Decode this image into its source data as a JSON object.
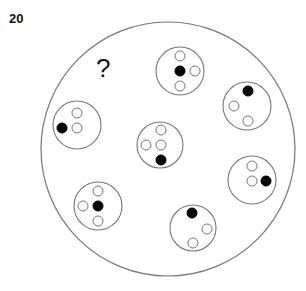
{
  "puzzle": {
    "number": "20",
    "unknown_marker": "?"
  },
  "colors": {
    "outline": "#777777",
    "filled_dot": "#000000",
    "open_dot_fill": "#ffffff",
    "background": "#ffffff"
  },
  "outer_circle": {
    "cx": 168,
    "cy": 149,
    "r": 127
  },
  "groups": [
    {
      "id": "top",
      "cx": 180,
      "cy": 71,
      "r": 24,
      "dots": [
        {
          "x": 180,
          "y": 56,
          "filled": false
        },
        {
          "x": 180,
          "y": 71,
          "filled": true
        },
        {
          "x": 195,
          "y": 71,
          "filled": false
        },
        {
          "x": 180,
          "y": 86,
          "filled": false
        }
      ]
    },
    {
      "id": "upper-right",
      "cx": 247,
      "cy": 106,
      "r": 24,
      "dots": [
        {
          "x": 248,
          "y": 91,
          "filled": true
        },
        {
          "x": 234,
          "y": 106,
          "filled": false
        },
        {
          "x": 248,
          "y": 121,
          "filled": false
        }
      ]
    },
    {
      "id": "left",
      "cx": 77,
      "cy": 125,
      "r": 24,
      "dots": [
        {
          "x": 77,
          "y": 113,
          "filled": false
        },
        {
          "x": 62,
          "y": 128,
          "filled": true
        },
        {
          "x": 77,
          "y": 128,
          "filled": false
        }
      ]
    },
    {
      "id": "center",
      "cx": 160,
      "cy": 145,
      "r": 23,
      "dots": [
        {
          "x": 161,
          "y": 130,
          "filled": false
        },
        {
          "x": 146,
          "y": 145,
          "filled": false
        },
        {
          "x": 161,
          "y": 145,
          "filled": false
        },
        {
          "x": 161,
          "y": 160,
          "filled": true
        }
      ]
    },
    {
      "id": "right",
      "cx": 252,
      "cy": 180,
      "r": 24,
      "dots": [
        {
          "x": 252,
          "y": 166,
          "filled": false
        },
        {
          "x": 252,
          "y": 181,
          "filled": false
        },
        {
          "x": 266,
          "y": 181,
          "filled": true
        }
      ]
    },
    {
      "id": "lower-left",
      "cx": 98,
      "cy": 206,
      "r": 24,
      "dots": [
        {
          "x": 98,
          "y": 191,
          "filled": false
        },
        {
          "x": 83,
          "y": 206,
          "filled": false
        },
        {
          "x": 98,
          "y": 206,
          "filled": true
        },
        {
          "x": 98,
          "y": 221,
          "filled": false
        }
      ]
    },
    {
      "id": "bottom",
      "cx": 193,
      "cy": 228,
      "r": 23,
      "dots": [
        {
          "x": 192,
          "y": 213,
          "filled": true
        },
        {
          "x": 207,
          "y": 229,
          "filled": false
        },
        {
          "x": 193,
          "y": 243,
          "filled": false
        }
      ]
    }
  ],
  "dot_radius": 5
}
